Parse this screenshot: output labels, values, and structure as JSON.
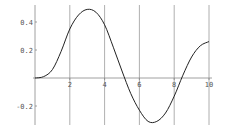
{
  "chart_data": {
    "type": "line",
    "title": "",
    "xlabel": "",
    "ylabel": "",
    "xlim": [
      0,
      10
    ],
    "ylim": [
      -0.35,
      0.52
    ],
    "grid": "vertical lines at x ticks",
    "x_ticks": [
      2,
      4,
      6,
      8,
      10
    ],
    "x_tick_labels": [
      "2",
      "4",
      "6",
      "8",
      "10"
    ],
    "y_ticks": [
      0.4,
      0.2,
      -0.2
    ],
    "y_tick_labels": [
      "0.4",
      "0.2",
      "-0.2"
    ],
    "series": [
      {
        "name": "f(x)",
        "color": "#222222",
        "x": [
          0,
          0.5,
          1,
          1.5,
          2,
          2.5,
          3,
          3.5,
          4,
          4.5,
          5,
          5.5,
          6,
          6.5,
          7,
          7.5,
          8,
          8.5,
          9,
          9.5,
          10
        ],
        "values": [
          0,
          0.01,
          0.06,
          0.19,
          0.35,
          0.45,
          0.49,
          0.47,
          0.38,
          0.22,
          0.05,
          -0.11,
          -0.23,
          -0.31,
          -0.31,
          -0.25,
          -0.13,
          0.02,
          0.15,
          0.23,
          0.26
        ]
      }
    ],
    "colors": {
      "axis": "#888888",
      "grid": "#9a9a9a",
      "curve": "#222222"
    }
  }
}
